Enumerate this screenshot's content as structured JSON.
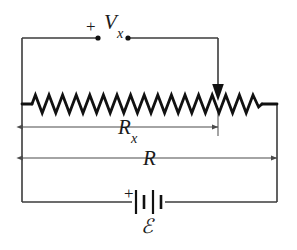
{
  "figure": {
    "background_color": "#ffffff",
    "wire_color": "#3b3b3b",
    "component_color": "#111111",
    "dimension_line_color": "#4a4a4a",
    "width": 297,
    "height": 250
  },
  "labels": {
    "vx": "V",
    "vx_subscript": "x",
    "plus_top": "+",
    "rx": "R",
    "rx_subscript": "x",
    "r": "R",
    "plus_battery": "+",
    "emf": "ℰ"
  },
  "components": {
    "resistor": {
      "name": "variable-resistor",
      "label": "R",
      "zigzag_peaks": 17,
      "x_start": 32,
      "x_end": 262,
      "y_center": 104
    },
    "wiper": {
      "name": "wiper-arrow",
      "tap_x": 218,
      "arrow_from_y": 48,
      "arrow_to_y": 100
    },
    "battery": {
      "name": "battery-emf",
      "label": "ℰ",
      "polarity": "+",
      "cells": 2,
      "plate_count": 4,
      "center_x": 148,
      "center_y": 202
    },
    "terminals": {
      "name": "voltage-measurement-terminals",
      "left_dot_x": 98,
      "right_dot_x": 128,
      "y": 38
    }
  },
  "dimensions": [
    {
      "name": "rx-dimension",
      "label": "R",
      "subscript": "x",
      "x_start": 22,
      "x_end": 218,
      "y": 127
    },
    {
      "name": "r-dimension",
      "label": "R",
      "subscript": "",
      "x_start": 22,
      "x_end": 277,
      "y": 158
    }
  ],
  "measurement": {
    "measured_quantity": "V",
    "measured_subscript": "x",
    "across": "R",
    "across_subscript": "x"
  }
}
